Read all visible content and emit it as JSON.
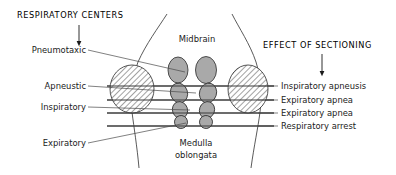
{
  "figure": {
    "width": 396,
    "height": 175,
    "background": "#ffffff"
  },
  "headers": {
    "left": "RESPIRATORY CENTERS",
    "right": "EFFECT OF SECTIONING"
  },
  "anatomy_labels": {
    "midbrain": "Midbrain",
    "medulla_line1": "Medulla",
    "medulla_line2": "oblongata"
  },
  "left_labels": [
    {
      "text": "Pneumotaxic"
    },
    {
      "text": "Apneustic"
    },
    {
      "text": "Inspiratory"
    },
    {
      "text": "Expiratory"
    }
  ],
  "right_labels": [
    {
      "text": "Inspiratory  apneusis"
    },
    {
      "text": "Expiratory apnea"
    },
    {
      "text": "Expiratory apnea"
    },
    {
      "text": "Respiratory arrest"
    }
  ],
  "colors": {
    "nucleus_fill": "#a9a9a9",
    "stroke": "#2b2b2b",
    "line": "#3c3c3c",
    "leader": "#4a4a4a",
    "text": "#1a1a1a",
    "hatch": "#555555"
  },
  "section_lines": {
    "count": 4,
    "y_values": [
      86,
      100,
      113,
      126
    ]
  }
}
